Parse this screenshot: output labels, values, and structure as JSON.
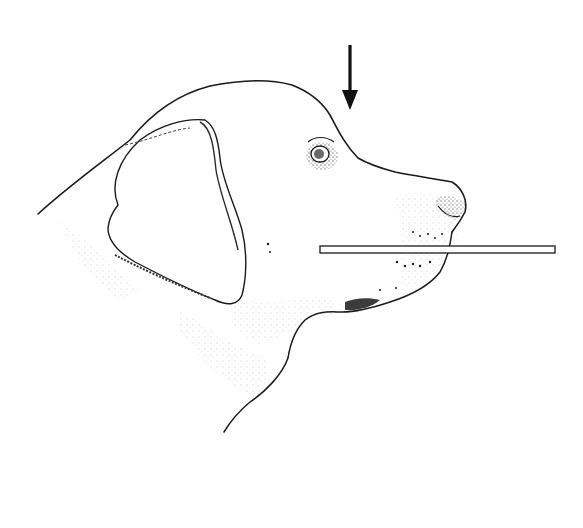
{
  "figure": {
    "annotations": [
      {
        "type": "arrow",
        "direction": "down",
        "points_to": "stop"
      },
      {
        "type": "straight-edge bar",
        "orientation": "horizontal",
        "placed_along": "lower jaw / muzzle"
      }
    ],
    "colors": {
      "ink": "#1a1a1a",
      "background": "#ffffff",
      "shading": "#555555"
    }
  }
}
